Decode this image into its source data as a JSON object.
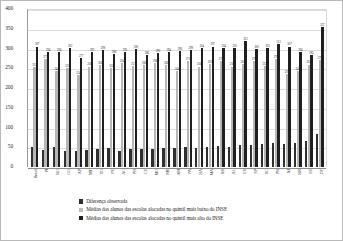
{
  "chart_data": {
    "type": "bar",
    "title": "",
    "xlabel": "",
    "ylabel": "",
    "ylim": [
      0,
      400
    ],
    "yticks": [
      400,
      350,
      300,
      250,
      200,
      150,
      100,
      50,
      0
    ],
    "grid": true,
    "legend_position": "bottom",
    "categories": [
      "Brasil",
      "PI",
      "RO",
      "GO",
      "AP",
      "MT",
      "TO",
      "PE",
      "AC",
      "PB",
      "CE",
      "MG",
      "MS",
      "AM",
      "PA",
      "BA",
      "MA",
      "RS",
      "AL",
      "ES",
      "SP",
      "SC",
      "PR",
      "RJ",
      "RN",
      "SE",
      "DF"
    ],
    "series": [
      {
        "name": "Diferença observada",
        "color": "#2f2f2f",
        "values": [
          52,
          44,
          51,
          40,
          42,
          43,
          45,
          48,
          40,
          45,
          47,
          45,
          49,
          48,
          50,
          49,
          51,
          53,
          52,
          57,
          55,
          59,
          60,
          58,
          62,
          66,
          84
        ]
      },
      {
        "name": "Médias dos alunos das escolas alocadas no quintil mais baixo do INSE",
        "color": "#bcbcbc",
        "values": [
          255,
          275,
          244,
          253,
          234,
          256,
          260,
          252,
          264,
          257,
          260,
          266,
          260,
          244,
          271,
          256,
          262,
          270,
          256,
          262,
          270,
          257,
          276,
          236,
          245,
          261,
          272
        ]
      },
      {
        "name": "Médias dos alunos das escolas alocadas no quintil mais alto do INSE",
        "color": "#1f1f1f",
        "values": [
          307,
          294,
          294,
          302,
          277,
          293,
          298,
          288,
          293,
          300,
          286,
          290,
          294,
          296,
          298,
          304,
          307,
          304,
          303,
          321,
          300,
          303,
          313,
          307,
          294,
          285,
          357
        ]
      }
    ],
    "data_labels": {
      "series1": [
        "255",
        "275",
        "244",
        "253",
        "234",
        "256",
        "260",
        "252",
        "264",
        "257",
        "260",
        "266",
        "260",
        "244",
        "271",
        "256",
        "262",
        "270",
        "256",
        "262",
        "270",
        "257",
        "276",
        "236",
        "245",
        "261",
        "272"
      ],
      "series2": [
        "307",
        "294",
        "294",
        "302",
        "277",
        "293",
        "298",
        "288",
        "293",
        "300",
        "286",
        "290",
        "294",
        "296",
        "298",
        "304",
        "307",
        "304",
        "303",
        "321",
        "300",
        "303",
        "313",
        "307",
        "294",
        "285",
        "357"
      ]
    }
  },
  "legend": {
    "items": [
      {
        "label": "Diferença observada",
        "swatch": "c0"
      },
      {
        "label": "Médias dos alunos das escolas alocadas no quintil mais baixo do INSE",
        "swatch": "c1"
      },
      {
        "label": "Médias dos alunos das escolas alocadas no quintil mais alto do INSE",
        "swatch": "c2"
      }
    ]
  }
}
